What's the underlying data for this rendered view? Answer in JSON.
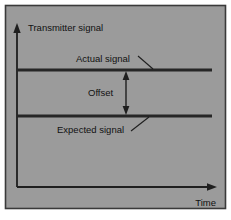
{
  "figure": {
    "kind": "line-diagram",
    "title_text": "",
    "background_color": "#ffffff",
    "panel_color": "#9b9b9b",
    "panel_border_color": "#3a3a3a",
    "line_color": "#262626",
    "axis_color": "#1f1f1f",
    "text_color": "#111111"
  },
  "axes": {
    "y_axis": {
      "label": "Transmitter signal",
      "arrow": "up-arrow-icon",
      "x": 17,
      "y_top": 26,
      "y_bottom": 187
    },
    "x_axis": {
      "label": "Time",
      "arrow": "right-arrow-icon",
      "y": 187,
      "x_left": 17,
      "x_right": 214
    }
  },
  "signals": [
    {
      "name": "actual-signal",
      "label": "Actual signal",
      "y": 70,
      "x_start": 17,
      "x_end": 212,
      "label_x": 76,
      "label_y": 59,
      "leader": {
        "x1": 138,
        "y1": 56,
        "x2": 153,
        "y2": 69
      }
    },
    {
      "name": "expected-signal",
      "label": "Expected signal",
      "y": 116,
      "x_start": 17,
      "x_end": 212,
      "label_x": 57,
      "label_y": 130,
      "leader": {
        "x1": 131,
        "y1": 131,
        "x2": 149,
        "y2": 117
      }
    }
  ],
  "offset_annotation": {
    "label": "Offset",
    "arrow": "double-headed-vertical-arrow-icon",
    "x": 126,
    "y_top": 71,
    "y_bottom": 115,
    "label_x": 88,
    "label_y": 93
  }
}
